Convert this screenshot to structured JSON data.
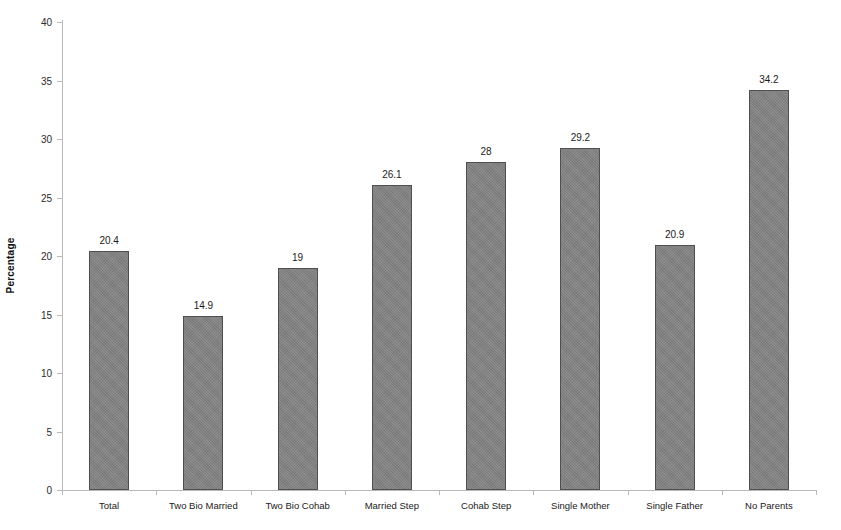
{
  "chart_data": {
    "type": "bar",
    "title": "",
    "xlabel": "",
    "ylabel": "Percentage",
    "ylim": [
      0,
      40
    ],
    "ytick_step": 5,
    "yticks": [
      0,
      5,
      10,
      15,
      20,
      25,
      30,
      35,
      40
    ],
    "ytick_labels": [
      "0",
      "5",
      "10",
      "15",
      "20",
      "25",
      "30",
      "35",
      "40"
    ],
    "grid": false,
    "legend": false,
    "bar_color": "#808080",
    "bar_border_color": "#4f4f4f",
    "axis_color": "#b9b9b9",
    "background": "#ffffff",
    "categories": [
      "Total",
      "Two Bio Married",
      "Two Bio Cohab",
      "Married Step",
      "Cohab Step",
      "Single Mother",
      "Single Father",
      "No Parents"
    ],
    "values": [
      20.4,
      14.9,
      19,
      26.1,
      28,
      29.2,
      20.9,
      34.2
    ],
    "value_labels": [
      "20.4",
      "14.9",
      "19",
      "26.1",
      "28",
      "29.2",
      "20.9",
      "34.2"
    ]
  }
}
